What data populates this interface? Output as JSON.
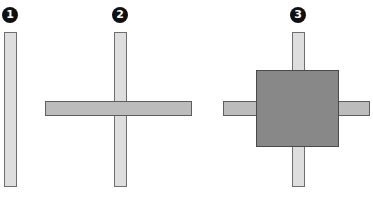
{
  "panels": [
    {
      "label": "1",
      "description": "single vertical bar",
      "badge": {
        "x": 2,
        "y": 7
      },
      "vertical_bar": {
        "x": 4,
        "y": 32,
        "w": 13,
        "h": 155,
        "color": "#dedede"
      }
    },
    {
      "label": "2",
      "description": "vertical bar crossed by horizontal bar",
      "badge": {
        "x": 112,
        "y": 7
      },
      "vertical_bar": {
        "x": 114,
        "y": 32,
        "w": 13,
        "h": 155,
        "color": "#dedede"
      },
      "horizontal_bar": {
        "x": 45,
        "y": 101,
        "w": 147,
        "h": 15,
        "color": "#bcbcbc"
      }
    },
    {
      "label": "3",
      "description": "cross with dark square covering intersection",
      "badge": {
        "x": 290,
        "y": 7
      },
      "vertical_bar": {
        "x": 292,
        "y": 32,
        "w": 13,
        "h": 155,
        "color": "#dedede"
      },
      "horizontal_bar": {
        "x": 223,
        "y": 101,
        "w": 147,
        "h": 15,
        "color": "#bcbcbc"
      },
      "square": {
        "x": 256,
        "y": 70,
        "w": 83,
        "h": 77,
        "color": "#888888"
      }
    }
  ]
}
